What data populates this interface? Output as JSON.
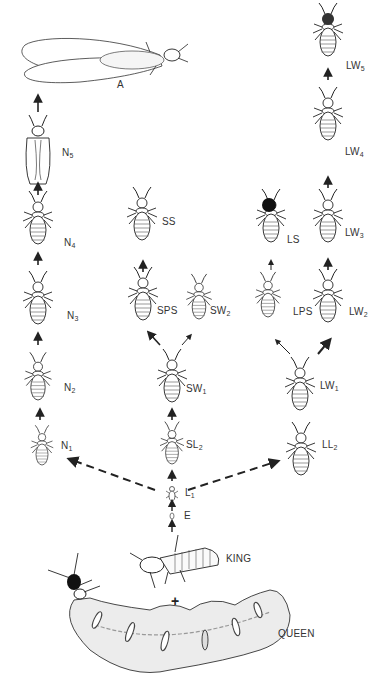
{
  "diagram": {
    "nodes": [
      {
        "id": "A",
        "label": "A",
        "sub": ""
      },
      {
        "id": "N5",
        "label": "N",
        "sub": "5"
      },
      {
        "id": "N4",
        "label": "N",
        "sub": "4"
      },
      {
        "id": "N3",
        "label": "N",
        "sub": "3"
      },
      {
        "id": "N2",
        "label": "N",
        "sub": "2"
      },
      {
        "id": "N1",
        "label": "N",
        "sub": "1"
      },
      {
        "id": "SS",
        "label": "SS",
        "sub": ""
      },
      {
        "id": "SPS",
        "label": "SPS",
        "sub": ""
      },
      {
        "id": "SW2",
        "label": "SW",
        "sub": "2"
      },
      {
        "id": "SW1",
        "label": "SW",
        "sub": "1"
      },
      {
        "id": "SL2",
        "label": "SL",
        "sub": "2"
      },
      {
        "id": "LS",
        "label": "LS",
        "sub": ""
      },
      {
        "id": "LPS",
        "label": "LPS",
        "sub": ""
      },
      {
        "id": "LW5",
        "label": "LW",
        "sub": "5"
      },
      {
        "id": "LW4",
        "label": "LW",
        "sub": "4"
      },
      {
        "id": "LW3",
        "label": "LW",
        "sub": "3"
      },
      {
        "id": "LW2",
        "label": "LW",
        "sub": "2"
      },
      {
        "id": "LW1",
        "label": "LW",
        "sub": "1"
      },
      {
        "id": "LL2",
        "label": "LL",
        "sub": "2"
      },
      {
        "id": "L1",
        "label": "L",
        "sub": "1"
      },
      {
        "id": "E",
        "label": "E",
        "sub": ""
      },
      {
        "id": "KING",
        "label": "KING",
        "sub": ""
      },
      {
        "id": "QUEEN",
        "label": "QUEEN",
        "sub": ""
      }
    ],
    "edges": [
      [
        "KING",
        "E"
      ],
      [
        "QUEEN",
        "E"
      ],
      [
        "E",
        "L1"
      ],
      [
        "L1",
        "N1"
      ],
      [
        "L1",
        "SL2"
      ],
      [
        "L1",
        "LL2"
      ],
      [
        "N1",
        "N2"
      ],
      [
        "N2",
        "N3"
      ],
      [
        "N3",
        "N4"
      ],
      [
        "N4",
        "N5"
      ],
      [
        "N5",
        "A"
      ],
      [
        "SL2",
        "SW1"
      ],
      [
        "SW1",
        "SPS"
      ],
      [
        "SW1",
        "SW2"
      ],
      [
        "SPS",
        "SS"
      ],
      [
        "LL2",
        "LW1"
      ],
      [
        "LW1",
        "LPS"
      ],
      [
        "LW1",
        "LW2"
      ],
      [
        "LPS",
        "LS"
      ],
      [
        "LW2",
        "LW3"
      ],
      [
        "LW3",
        "LW4"
      ],
      [
        "LW4",
        "LW5"
      ]
    ],
    "plus_sign": "+",
    "colors": {
      "ink": "#222222",
      "background": "#ffffff",
      "shade": "#e8e8e8"
    }
  }
}
